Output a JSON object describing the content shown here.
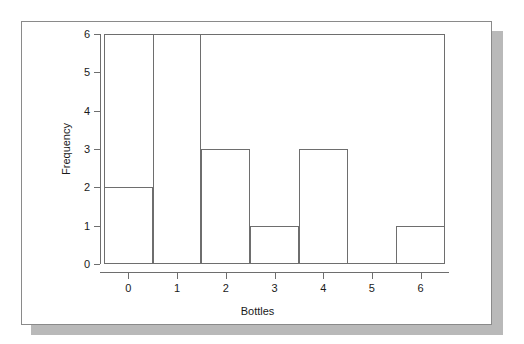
{
  "document": {
    "kind": "scanned-figure-card",
    "background_color": "#ffffff",
    "card_color": "#ffffff",
    "card_border_color": "#8a8a8a",
    "shadow_color": "#b9b9b9"
  },
  "chart_data": {
    "type": "bar",
    "subtype": "histogram",
    "title": "",
    "subtitle": "",
    "xlabel": "Bottles",
    "ylabel": "Frequency",
    "categories": [
      "0",
      "1",
      "2",
      "3",
      "4",
      "5",
      "6"
    ],
    "values": [
      2,
      6,
      3,
      1,
      3,
      0,
      1
    ],
    "x": [
      0,
      1,
      2,
      3,
      4,
      5,
      6
    ],
    "bin_edges": [
      -0.5,
      0.5,
      1.5,
      2.5,
      3.5,
      4.5,
      5.5,
      6.5
    ],
    "xlim": [
      -0.5,
      6.5
    ],
    "ylim": [
      0,
      6
    ],
    "x_tick_labels": [
      "0",
      "1",
      "2",
      "3",
      "4",
      "5",
      "6"
    ],
    "y_tick_labels": [
      "0",
      "1",
      "2",
      "3",
      "4",
      "5",
      "6"
    ],
    "y_ticks": [
      0,
      1,
      2,
      3,
      4,
      5,
      6
    ],
    "grid": false,
    "legend": false,
    "legend_position": "none",
    "bar_fill_color": "#ffffff",
    "bar_edge_color": "#6e6e6e",
    "axis_color": "#6e6e6e",
    "text_color": "#1a1a1a",
    "annotations": []
  }
}
